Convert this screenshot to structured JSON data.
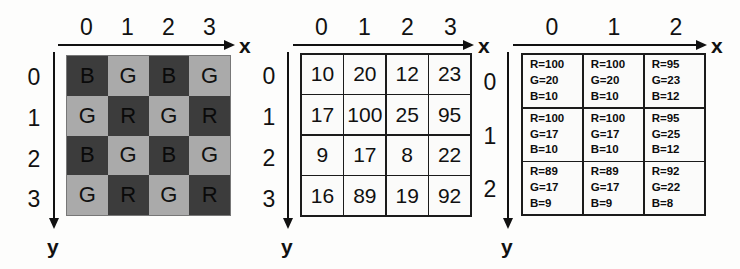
{
  "figure": {
    "axis_x_label": "x",
    "axis_y_label": "y"
  },
  "panels": {
    "bayer": {
      "name": "bayer-cfa-pattern",
      "col_ticks": [
        "0",
        "1",
        "2",
        "3"
      ],
      "row_ticks": [
        "0",
        "1",
        "2",
        "3"
      ],
      "axis_x_label": "x",
      "axis_y_label": "y",
      "colors": {
        "dark_cell": "#3c3c3c",
        "light_cell": "#aaaaaa",
        "grid_line": "#777777"
      },
      "rows": [
        [
          {
            "letter": "B",
            "tone": "dark"
          },
          {
            "letter": "G",
            "tone": "light"
          },
          {
            "letter": "B",
            "tone": "dark"
          },
          {
            "letter": "G",
            "tone": "light"
          }
        ],
        [
          {
            "letter": "G",
            "tone": "light"
          },
          {
            "letter": "R",
            "tone": "dark"
          },
          {
            "letter": "G",
            "tone": "light"
          },
          {
            "letter": "R",
            "tone": "dark"
          }
        ],
        [
          {
            "letter": "B",
            "tone": "dark"
          },
          {
            "letter": "G",
            "tone": "light"
          },
          {
            "letter": "B",
            "tone": "dark"
          },
          {
            "letter": "G",
            "tone": "light"
          }
        ],
        [
          {
            "letter": "G",
            "tone": "light"
          },
          {
            "letter": "R",
            "tone": "dark"
          },
          {
            "letter": "G",
            "tone": "light"
          },
          {
            "letter": "R",
            "tone": "dark"
          }
        ]
      ]
    },
    "values": {
      "name": "raw-sensor-values",
      "col_ticks": [
        "0",
        "1",
        "2",
        "3"
      ],
      "row_ticks": [
        "0",
        "1",
        "2",
        "3"
      ],
      "axis_x_label": "x",
      "axis_y_label": "y",
      "rows": [
        [
          "10",
          "20",
          "12",
          "23"
        ],
        [
          "17",
          "100",
          "25",
          "95"
        ],
        [
          "9",
          "17",
          "8",
          "22"
        ],
        [
          "16",
          "89",
          "19",
          "92"
        ]
      ]
    },
    "rgb": {
      "name": "demosaiced-rgb-values",
      "col_ticks": [
        "0",
        "1",
        "2"
      ],
      "row_ticks": [
        "0",
        "1",
        "2"
      ],
      "axis_x_label": "x",
      "axis_y_label": "y",
      "rows": [
        [
          {
            "r": "R=100",
            "g": "G=20",
            "b": "B=10"
          },
          {
            "r": "R=100",
            "g": "G=20",
            "b": "B=10"
          },
          {
            "r": "R=95",
            "g": "G=23",
            "b": "B=12"
          }
        ],
        [
          {
            "r": "R=100",
            "g": "G=17",
            "b": "B=10"
          },
          {
            "r": "R=100",
            "g": "G=17",
            "b": "B=10"
          },
          {
            "r": "R=95",
            "g": "G=25",
            "b": "B=12"
          }
        ],
        [
          {
            "r": "R=89",
            "g": "G=17",
            "b": "B=9"
          },
          {
            "r": "R=89",
            "g": "G=17",
            "b": "B=9"
          },
          {
            "r": "R=92",
            "g": "G=22",
            "b": "B=8"
          }
        ]
      ]
    }
  }
}
